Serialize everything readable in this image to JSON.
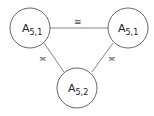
{
  "nodes": [
    {
      "id": "left",
      "base": "A",
      "sub": "5,1"
    },
    {
      "id": "right",
      "base": "A",
      "sub": "5,1"
    },
    {
      "id": "bottom",
      "base": "A",
      "sub": "5,2"
    }
  ],
  "edges": [
    {
      "from": "left",
      "to": "right",
      "label": "≅"
    },
    {
      "from": "left",
      "to": "bottom",
      "label": "≍"
    },
    {
      "from": "right",
      "to": "bottom",
      "label": "≍"
    }
  ],
  "colors": {
    "stroke": "#555555",
    "text": "#222222"
  }
}
